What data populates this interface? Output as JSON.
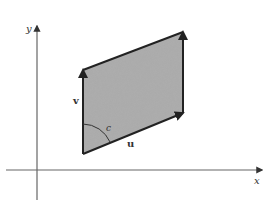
{
  "diagram": {
    "type": "parallelogram-vectors",
    "axes": {
      "x_label": "x",
      "y_label": "y"
    },
    "vectors": [
      {
        "name": "u",
        "label": "u",
        "from": "origin-corner",
        "direction": "right-up"
      },
      {
        "name": "v",
        "label": "v",
        "from": "origin-corner",
        "direction": "up"
      }
    ],
    "angle_label": "c",
    "colors": {
      "fill": "#9a9a9a",
      "stroke": "#222222",
      "axis": "#555555"
    }
  }
}
